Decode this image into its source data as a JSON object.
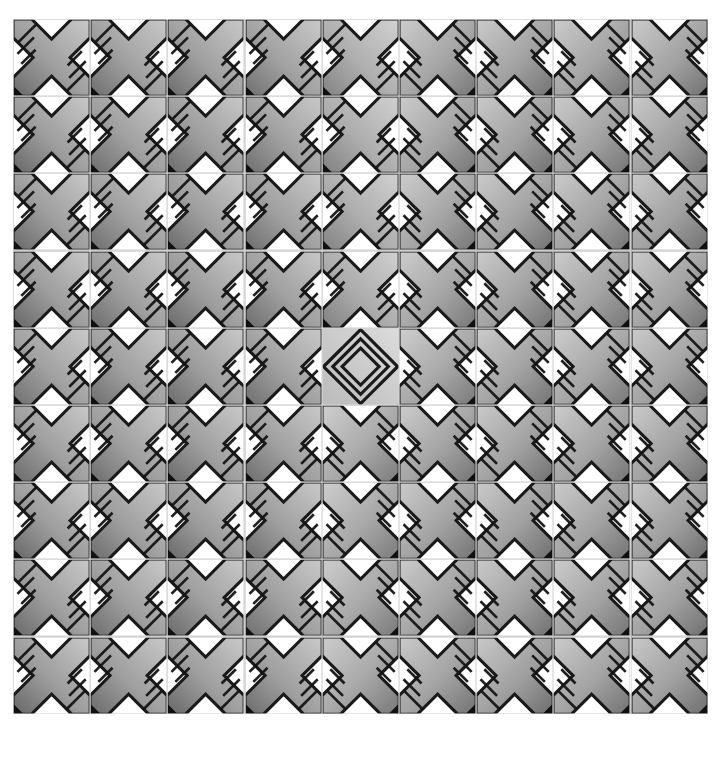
{
  "artwork": {
    "title": "Tiled X-Cross Pattern",
    "description": "Repeating grid of embossed X / cross shaped tiles with diagonal hatch details",
    "background_color": "#ffffff",
    "canvas": {
      "width": 724,
      "height": 758
    }
  },
  "grid": {
    "columns": 9,
    "rows": 9,
    "tile_size": 77.2,
    "offset_x": 13,
    "offset_y": 19,
    "gap": 0,
    "grout_color": "#d8d8d8",
    "grout_width": 1.2
  },
  "palette": {
    "outline": "#1a1a1a",
    "tile_background": "#ffffff",
    "grout": "#d4d4d4",
    "corner_block": "#101010",
    "gradient_dark": "#3d3d3d",
    "gradient_mid": "#8a8a8a",
    "gradient_light": "#c9c9c9",
    "gradient_xlight": "#e2e2e2",
    "hatch_line": "#151515"
  },
  "tile_variants": [
    {
      "id": "cross-left",
      "name": "X-cross, hatch upper-left",
      "mirrored": false
    },
    {
      "id": "cross-right",
      "name": "X-cross, hatch upper-right",
      "mirrored": true
    },
    {
      "id": "diamond",
      "name": "Concentric diamond medallion",
      "mirrored": false
    }
  ],
  "chart_data": {
    "type": "heatmap",
    "xlabel": "column",
    "ylabel": "row",
    "categories": [
      "1",
      "2",
      "3",
      "4",
      "5",
      "6",
      "7",
      "8",
      "9"
    ],
    "rows": [
      "1",
      "2",
      "3",
      "4",
      "5",
      "6",
      "7",
      "8",
      "9"
    ],
    "grid_layout": [
      [
        {
          "variant": "cross-left",
          "tone": 0.46,
          "rot": 0
        },
        {
          "variant": "cross-left",
          "tone": 0.5,
          "rot": 0
        },
        {
          "variant": "cross-left",
          "tone": 0.48,
          "rot": 0
        },
        {
          "variant": "cross-left",
          "tone": 0.52,
          "rot": 0
        },
        {
          "variant": "cross-left",
          "tone": 0.72,
          "rot": 0
        },
        {
          "variant": "cross-right",
          "tone": 0.6,
          "rot": 0
        },
        {
          "variant": "cross-right",
          "tone": 0.55,
          "rot": 0
        },
        {
          "variant": "cross-right",
          "tone": 0.58,
          "rot": 0
        },
        {
          "variant": "cross-right",
          "tone": 0.54,
          "rot": 0
        }
      ],
      [
        {
          "variant": "cross-left",
          "tone": 0.44,
          "rot": 0
        },
        {
          "variant": "cross-left",
          "tone": 0.49,
          "rot": 0
        },
        {
          "variant": "cross-left",
          "tone": 0.47,
          "rot": 0
        },
        {
          "variant": "cross-left",
          "tone": 0.51,
          "rot": 0
        },
        {
          "variant": "cross-left",
          "tone": 0.7,
          "rot": 0
        },
        {
          "variant": "cross-right",
          "tone": 0.58,
          "rot": 0
        },
        {
          "variant": "cross-right",
          "tone": 0.53,
          "rot": 0
        },
        {
          "variant": "cross-right",
          "tone": 0.57,
          "rot": 0
        },
        {
          "variant": "cross-right",
          "tone": 0.52,
          "rot": 0
        }
      ],
      [
        {
          "variant": "cross-left",
          "tone": 0.45,
          "rot": 0
        },
        {
          "variant": "cross-left",
          "tone": 0.5,
          "rot": 0
        },
        {
          "variant": "cross-left",
          "tone": 0.46,
          "rot": 0
        },
        {
          "variant": "cross-left",
          "tone": 0.5,
          "rot": 0
        },
        {
          "variant": "cross-left",
          "tone": 0.71,
          "rot": 0
        },
        {
          "variant": "cross-right",
          "tone": 0.59,
          "rot": 0
        },
        {
          "variant": "cross-right",
          "tone": 0.54,
          "rot": 0
        },
        {
          "variant": "cross-right",
          "tone": 0.56,
          "rot": 0
        },
        {
          "variant": "cross-right",
          "tone": 0.53,
          "rot": 0
        }
      ],
      [
        {
          "variant": "cross-left",
          "tone": 0.43,
          "rot": 0
        },
        {
          "variant": "cross-left",
          "tone": 0.48,
          "rot": 0
        },
        {
          "variant": "cross-left",
          "tone": 0.45,
          "rot": 0
        },
        {
          "variant": "cross-left",
          "tone": 0.49,
          "rot": 0
        },
        {
          "variant": "cross-left",
          "tone": 0.69,
          "rot": 0
        },
        {
          "variant": "cross-right",
          "tone": 0.6,
          "rot": 0
        },
        {
          "variant": "cross-right",
          "tone": 0.55,
          "rot": 0
        },
        {
          "variant": "cross-right",
          "tone": 0.58,
          "rot": 0
        },
        {
          "variant": "cross-right",
          "tone": 0.54,
          "rot": 0
        }
      ],
      [
        {
          "variant": "cross-left",
          "tone": 0.52,
          "rot": 0
        },
        {
          "variant": "cross-left",
          "tone": 0.5,
          "rot": 0
        },
        {
          "variant": "cross-left",
          "tone": 0.47,
          "rot": 0
        },
        {
          "variant": "cross-left",
          "tone": 0.51,
          "rot": 0
        },
        {
          "variant": "diamond",
          "tone": 0.78,
          "rot": 0
        },
        {
          "variant": "cross-right",
          "tone": 0.62,
          "rot": 0
        },
        {
          "variant": "cross-right",
          "tone": 0.56,
          "rot": 0
        },
        {
          "variant": "cross-right",
          "tone": 0.59,
          "rot": 0
        },
        {
          "variant": "cross-right",
          "tone": 0.55,
          "rot": 0
        }
      ],
      [
        {
          "variant": "cross-left",
          "tone": 0.46,
          "rot": 0
        },
        {
          "variant": "cross-left",
          "tone": 0.49,
          "rot": 0
        },
        {
          "variant": "cross-left",
          "tone": 0.46,
          "rot": 0
        },
        {
          "variant": "cross-left",
          "tone": 0.5,
          "rot": 0
        },
        {
          "variant": "cross-right",
          "tone": 0.64,
          "rot": 0
        },
        {
          "variant": "cross-right",
          "tone": 0.57,
          "rot": 0
        },
        {
          "variant": "cross-right",
          "tone": 0.53,
          "rot": 0
        },
        {
          "variant": "cross-right",
          "tone": 0.57,
          "rot": 0
        },
        {
          "variant": "cross-right",
          "tone": 0.52,
          "rot": 0
        }
      ],
      [
        {
          "variant": "cross-left",
          "tone": 0.44,
          "rot": 0
        },
        {
          "variant": "cross-left",
          "tone": 0.48,
          "rot": 0
        },
        {
          "variant": "cross-left",
          "tone": 0.45,
          "rot": 0
        },
        {
          "variant": "cross-left",
          "tone": 0.49,
          "rot": 0
        },
        {
          "variant": "cross-right",
          "tone": 0.63,
          "rot": 0
        },
        {
          "variant": "cross-right",
          "tone": 0.56,
          "rot": 0
        },
        {
          "variant": "cross-right",
          "tone": 0.52,
          "rot": 0
        },
        {
          "variant": "cross-right",
          "tone": 0.56,
          "rot": 0
        },
        {
          "variant": "cross-right",
          "tone": 0.51,
          "rot": 0
        }
      ],
      [
        {
          "variant": "cross-left",
          "tone": 0.45,
          "rot": 0
        },
        {
          "variant": "cross-left",
          "tone": 0.49,
          "rot": 0
        },
        {
          "variant": "cross-left",
          "tone": 0.46,
          "rot": 0
        },
        {
          "variant": "cross-left",
          "tone": 0.5,
          "rot": 0
        },
        {
          "variant": "cross-right",
          "tone": 0.62,
          "rot": 0
        },
        {
          "variant": "cross-right",
          "tone": 0.57,
          "rot": 0
        },
        {
          "variant": "cross-right",
          "tone": 0.53,
          "rot": 0
        },
        {
          "variant": "cross-right",
          "tone": 0.57,
          "rot": 0
        },
        {
          "variant": "cross-right",
          "tone": 0.52,
          "rot": 0
        }
      ],
      [
        {
          "variant": "cross-left",
          "tone": 0.43,
          "rot": 0
        },
        {
          "variant": "cross-left",
          "tone": 0.47,
          "rot": 0
        },
        {
          "variant": "cross-left",
          "tone": 0.44,
          "rot": 0
        },
        {
          "variant": "cross-left",
          "tone": 0.48,
          "rot": 0
        },
        {
          "variant": "cross-right",
          "tone": 0.61,
          "rot": 0
        },
        {
          "variant": "cross-right",
          "tone": 0.55,
          "rot": 0
        },
        {
          "variant": "cross-right",
          "tone": 0.51,
          "rot": 0
        },
        {
          "variant": "cross-right",
          "tone": 0.55,
          "rot": 0
        },
        {
          "variant": "cross-right",
          "tone": 0.5,
          "rot": 0
        }
      ]
    ]
  }
}
